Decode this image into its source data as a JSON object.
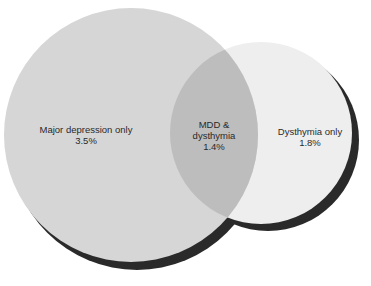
{
  "diagram": {
    "type": "venn",
    "colors": {
      "major_depression": "#d6d6d6",
      "dysthymia": "#eeeeee",
      "overlap": "#bdbdbd",
      "shadow": "#2a2a2a"
    },
    "regions": [
      {
        "id": "mdd_only",
        "label": "Major depression only",
        "value": "3.5%"
      },
      {
        "id": "overlap",
        "label_line1": "MDD &",
        "label_line2": "dysthymia",
        "value": "1.4%"
      },
      {
        "id": "dysthymia_only",
        "label": "Dysthymia only",
        "value": "1.8%"
      }
    ]
  }
}
